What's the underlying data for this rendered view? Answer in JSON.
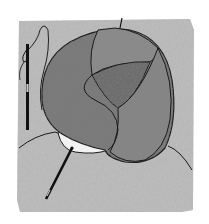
{
  "image": {
    "description": "Grayscale illustration of a round cushion made of patterned fabric pieces resting on knitted fabric, with a threaded needle standing at left and a needle inserted at bottom left",
    "colors": {
      "background": "#ffffff",
      "fabric": "#bdbdbd",
      "fabric_dark": "#a6a6a6",
      "cushion_main": "#7a7a7a",
      "cushion_panel_top": "#8a8a8a",
      "cushion_panel_inner": "#6c6c6c",
      "cushion_panel_right": "#858585",
      "outline": "#1a1a1a",
      "base_white": "#f2f2f2",
      "needle": "#111111"
    }
  }
}
